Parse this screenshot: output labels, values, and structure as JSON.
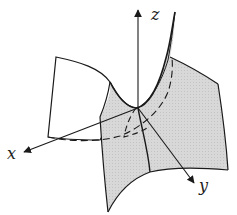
{
  "figure": {
    "axes": {
      "x": {
        "label": "x"
      },
      "y": {
        "label": "y"
      },
      "z": {
        "label": "z"
      }
    },
    "colors": {
      "line": "#1a1a1a",
      "surface_fill": "#d4d4d4",
      "background": "#ffffff"
    }
  }
}
